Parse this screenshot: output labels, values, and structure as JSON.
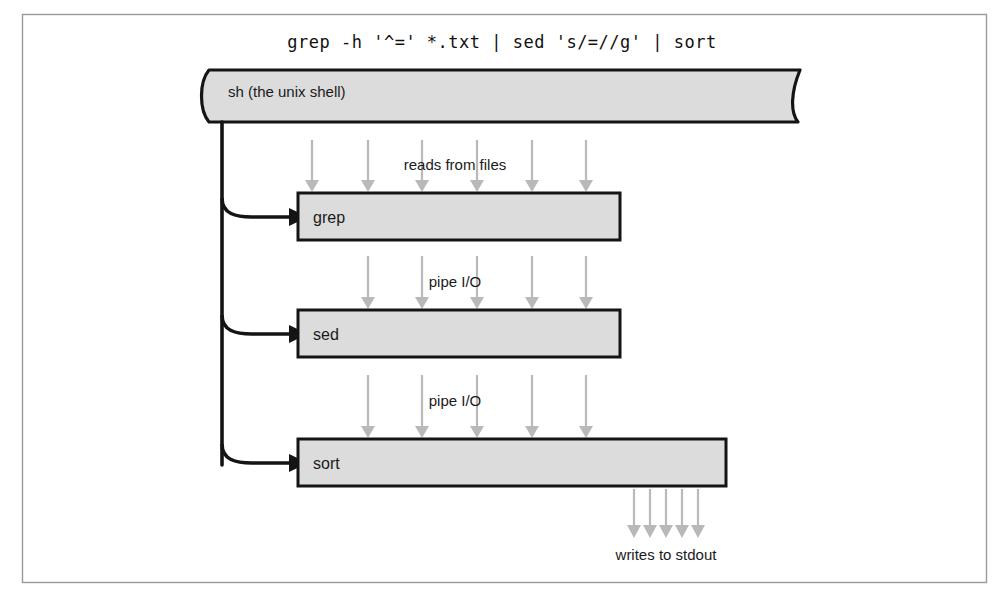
{
  "figure": {
    "command_line": "grep -h '^=' *.txt | sed 's/=//g' | sort",
    "shell": {
      "label": "sh (the unix shell)",
      "shape": "scroll-banner"
    },
    "stages": [
      {
        "id": "grep",
        "label": "grep",
        "inflow_label": "reads from files",
        "inflow_arrows": 6
      },
      {
        "id": "sed",
        "label": "sed",
        "inflow_label": "pipe I/O",
        "inflow_arrows": 5
      },
      {
        "id": "sort",
        "label": "sort",
        "inflow_label": "pipe I/O",
        "inflow_arrows": 5
      }
    ],
    "output": {
      "label": "writes to stdout",
      "arrows": 5
    },
    "colors": {
      "box_fill": "#dcdcdc",
      "box_stroke": "#141414",
      "flow_arrow": "#b9b9b9",
      "frame": "#9a9a9a",
      "text": "#1a1a1a",
      "background": "#ffffff"
    }
  }
}
